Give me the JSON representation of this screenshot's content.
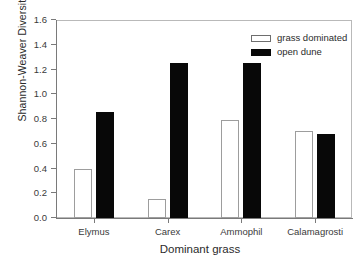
{
  "chart_data": {
    "type": "bar",
    "title": "",
    "xlabel": "Dominant grass",
    "ylabel": "Shannon-Weaver Diversity",
    "categories": [
      "Elymus",
      "Carex",
      "Ammophil",
      "Calamagrosti"
    ],
    "series": [
      {
        "name": "grass dominated",
        "color": "#ffffff",
        "edge": "#9d9d9d",
        "values": [
          0.4,
          0.15,
          0.79,
          0.7
        ]
      },
      {
        "name": "open dune",
        "color": "#080808",
        "edge": "#080808",
        "values": [
          0.86,
          1.25,
          1.25,
          0.68
        ]
      }
    ],
    "ylim": [
      0.0,
      1.6
    ],
    "ytick_labels": [
      "0.0",
      "0.2",
      "0.4",
      "0.6",
      "0.8",
      "1.0",
      "1.2",
      "1.4",
      "1.6"
    ],
    "ytick_values": [
      0.0,
      0.2,
      0.4,
      0.6,
      0.8,
      1.0,
      1.2,
      1.4,
      1.6
    ],
    "grid": false,
    "legend_position": "top-right",
    "legend_entries": [
      "grass dominated",
      "open dune"
    ]
  }
}
